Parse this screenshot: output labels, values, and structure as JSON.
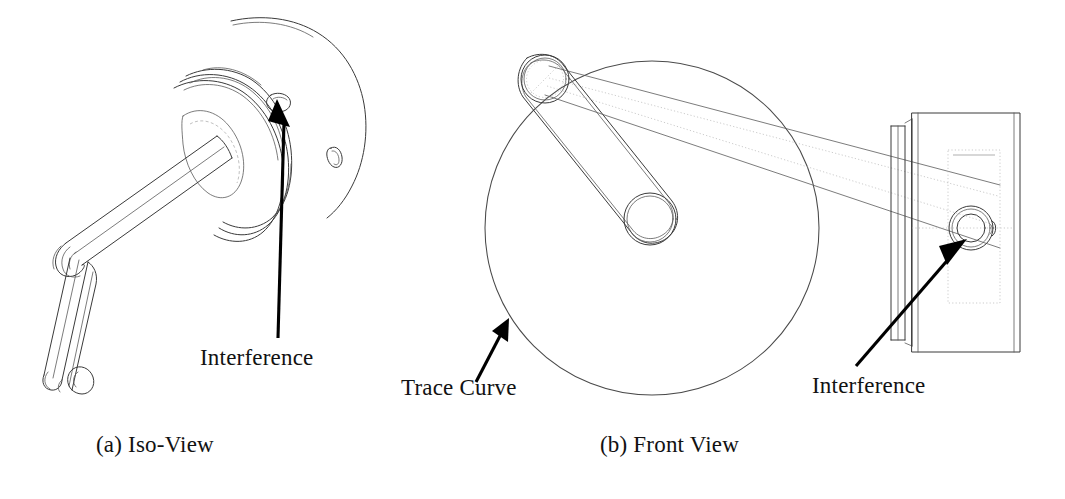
{
  "figure": {
    "type": "engineering-line-drawing",
    "panels": [
      {
        "id": "iso",
        "caption": "(a) Iso-View",
        "callouts": [
          {
            "name": "interference",
            "label": "Interference"
          }
        ]
      },
      {
        "id": "front",
        "caption": "(b) Front View",
        "callouts": [
          {
            "name": "trace-curve",
            "label": "Trace Curve"
          },
          {
            "name": "interference",
            "label": "Interference"
          }
        ]
      }
    ]
  },
  "labels": {
    "interference_left": "Interference",
    "trace_curve": "Trace Curve",
    "interference_right": "Interference"
  },
  "captions": {
    "iso_view": "(a) Iso-View",
    "front_view": "(b) Front View"
  },
  "colors": {
    "background": "#ffffff",
    "line": "#3a3a3a",
    "line_faint": "#8d8d8d",
    "hidden_line": "#a5a5a5",
    "text": "#121212",
    "leader": "#000000"
  }
}
